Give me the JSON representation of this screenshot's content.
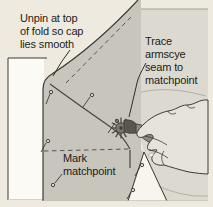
{
  "illustration": {
    "kind": "sewing instruction drawing",
    "labels": {
      "unpin": {
        "text": "Unpin at top of fold so cap lies smooth",
        "lines": [
          "Unpin at top",
          "of fold so cap",
          "lies smooth"
        ]
      },
      "trace": {
        "text": "Trace armscye seam to matchpoint",
        "lines": [
          "Trace",
          "armscye",
          "seam to",
          "matchpoint"
        ]
      },
      "mark": {
        "text": "Mark matchpoint",
        "lines": [
          "Mark",
          "matchpoint"
        ]
      }
    },
    "elements": {
      "pins_count": 7,
      "tool": "tracing wheel",
      "hand": "right hand holding tracing wheel",
      "pieces": [
        "pattern paper",
        "sleeve cap fabric (folded)",
        "bodice fabric"
      ],
      "guide_lines": [
        "fold dashed line",
        "matchpoint dashed line",
        "armscye seam line"
      ]
    },
    "colors": {
      "page_background": "#efeadf",
      "paper": "#fbfaf5",
      "sleeve_fabric": "#c8c5bd",
      "bodice_fabric": "#dcd9d1",
      "gap_white": "#f7f5ee",
      "hand": "#e6e3da",
      "tool_dark": "#4c4a45",
      "tool_mid": "#8d8a81",
      "ink": "#2e2d2a"
    }
  }
}
